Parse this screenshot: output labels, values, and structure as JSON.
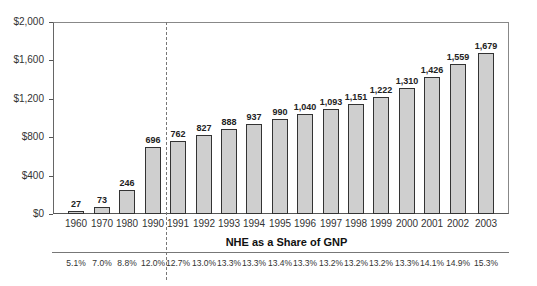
{
  "chart_data": {
    "type": "bar",
    "title": "",
    "xlabel": "",
    "ylabel": "",
    "ylim": [
      0,
      2000
    ],
    "yticks": [
      0,
      400,
      800,
      1200,
      1600,
      2000
    ],
    "ytick_labels": [
      "$0",
      "$400",
      "$800",
      "$1,200",
      "$1,600",
      "$2,000"
    ],
    "grid": false,
    "categories": [
      "1960",
      "1970",
      "1980",
      "1990",
      "1991",
      "1992",
      "1993",
      "1994",
      "1995",
      "1996",
      "1997",
      "1998",
      "1999",
      "2000",
      "2001",
      "2002",
      "2003"
    ],
    "values": [
      27,
      73,
      246,
      696,
      762,
      827,
      888,
      937,
      990,
      1040,
      1093,
      1151,
      1222,
      1310,
      1426,
      1559,
      1679
    ],
    "value_labels": [
      "27",
      "73",
      "246",
      "696",
      "762",
      "827",
      "888",
      "937",
      "990",
      "1,040",
      "1,093",
      "1,151",
      "1,222",
      "1,310",
      "1,426",
      "1,559",
      "1,679"
    ],
    "bar_color": "#cfcfcf",
    "bar_edge_color": "#333333",
    "annotations": {
      "vertical_dashed_separator_after": "1990"
    },
    "table": {
      "title": "NHE as a Share of GNP",
      "values": [
        "5.1%",
        "7.0%",
        "8.8%",
        "12.0%",
        "12.7%",
        "13.0%",
        "13.3%",
        "13.3%",
        "13.4%",
        "13.3%",
        "13.2%",
        "13.2%",
        "13.2%",
        "13.3%",
        "14.1%",
        "14.9%",
        "15.3%"
      ]
    }
  }
}
